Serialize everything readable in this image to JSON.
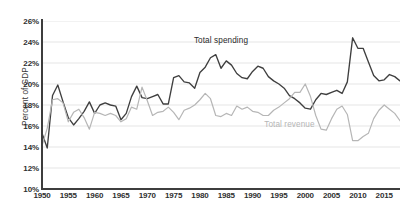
{
  "chart_data": {
    "type": "line",
    "title": "",
    "subtitle": "",
    "xlabel": "",
    "ylabel": "Percent of GDP",
    "xlim": [
      1950,
      2018
    ],
    "ylim": [
      10,
      26
    ],
    "ytick_step": 2,
    "grid": "horizontal",
    "legend_position": "inline-annotations",
    "y_ticks": [
      "10%",
      "12%",
      "14%",
      "16%",
      "18%",
      "20%",
      "22%",
      "24%",
      "26%"
    ],
    "y_tick_values": [
      10,
      12,
      14,
      16,
      18,
      20,
      22,
      24,
      26
    ],
    "x_ticks": [
      "1950",
      "1955",
      "1960",
      "1965",
      "1970",
      "1975",
      "1980",
      "1985",
      "1990",
      "1995",
      "2000",
      "2005",
      "2010",
      "2015"
    ],
    "x_tick_values": [
      1950,
      1955,
      1960,
      1965,
      1970,
      1975,
      1980,
      1985,
      1990,
      1995,
      2000,
      2005,
      2010,
      2015
    ],
    "x": [
      1950,
      1951,
      1952,
      1953,
      1954,
      1955,
      1956,
      1957,
      1958,
      1959,
      1960,
      1961,
      1962,
      1963,
      1964,
      1965,
      1966,
      1967,
      1968,
      1969,
      1970,
      1971,
      1972,
      1973,
      1974,
      1975,
      1976,
      1977,
      1978,
      1979,
      1980,
      1981,
      1982,
      1983,
      1984,
      1985,
      1986,
      1987,
      1988,
      1989,
      1990,
      1991,
      1992,
      1993,
      1994,
      1995,
      1996,
      1997,
      1998,
      1999,
      2000,
      2001,
      2002,
      2003,
      2004,
      2005,
      2006,
      2007,
      2008,
      2009,
      2010,
      2011,
      2012,
      2013,
      2014,
      2015,
      2016,
      2017,
      2018
    ],
    "series": [
      {
        "name": "Total spending",
        "color": "#3f3f3f",
        "label_x": 1984,
        "label_y": 24.0,
        "values": [
          15.3,
          13.9,
          18.9,
          19.9,
          18.3,
          16.8,
          16.1,
          16.7,
          17.4,
          18.3,
          17.2,
          18.0,
          18.2,
          18.0,
          17.9,
          16.6,
          17.2,
          18.8,
          19.8,
          18.7,
          18.6,
          18.8,
          19.0,
          18.1,
          18.1,
          20.6,
          20.8,
          20.2,
          20.1,
          19.6,
          21.1,
          21.6,
          22.5,
          22.8,
          21.5,
          22.2,
          21.8,
          21.0,
          20.6,
          20.5,
          21.2,
          21.7,
          21.5,
          20.7,
          20.3,
          20.0,
          19.6,
          18.9,
          18.6,
          18.2,
          17.7,
          17.6,
          18.5,
          19.1,
          19.0,
          19.2,
          19.4,
          19.1,
          20.2,
          24.4,
          23.4,
          23.4,
          22.1,
          20.8,
          20.3,
          20.4,
          20.9,
          20.7,
          20.3
        ]
      },
      {
        "name": "Total revenue",
        "color": "#b6b6b6",
        "label_x": 1997,
        "label_y": 16.1,
        "values": [
          14.1,
          15.8,
          18.5,
          18.6,
          18.2,
          16.4,
          17.3,
          17.6,
          16.8,
          15.7,
          17.3,
          17.2,
          17.0,
          17.2,
          17.0,
          16.4,
          16.7,
          17.8,
          17.6,
          19.7,
          18.4,
          17.0,
          17.3,
          17.4,
          17.8,
          17.3,
          16.6,
          17.5,
          17.7,
          18.0,
          18.5,
          19.1,
          18.6,
          17.0,
          16.9,
          17.2,
          17.0,
          17.9,
          17.6,
          17.8,
          17.4,
          17.3,
          17.0,
          17.0,
          17.5,
          17.8,
          18.2,
          18.6,
          19.2,
          19.2,
          20.0,
          18.8,
          17.0,
          15.7,
          15.6,
          16.7,
          17.6,
          17.9,
          17.1,
          14.6,
          14.6,
          15.0,
          15.3,
          16.7,
          17.5,
          18.0,
          17.6,
          17.2,
          16.5
        ]
      }
    ]
  }
}
